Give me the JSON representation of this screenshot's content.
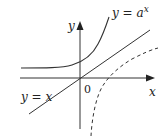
{
  "diagram": {
    "axes": {
      "x_label": "x",
      "y_label": "y",
      "origin_label": "0"
    },
    "curves": [
      {
        "name": "exponential",
        "label": "y = a",
        "exponent": "x",
        "style": "solid"
      },
      {
        "name": "identity",
        "label": "y = x",
        "style": "solid"
      },
      {
        "name": "logarithm",
        "label": "",
        "style": "dashed"
      }
    ],
    "colors": {
      "stroke": "#333333",
      "background": "#ffffff"
    }
  }
}
